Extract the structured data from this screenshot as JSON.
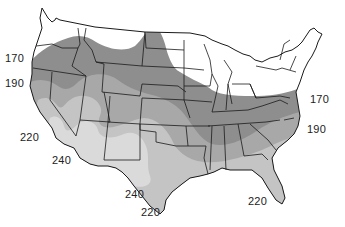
{
  "map": {
    "subject": "Contiguous United States — length of growing season zones",
    "colors": {
      "background": "#ffffff",
      "zone_under_170": "#ffffff",
      "zone_170_190": "#8e8e8e",
      "zone_190_220": "#a8a8a8",
      "zone_220_240": "#c4c4c4",
      "zone_over_240": "#dadada",
      "borders": "#1a1a1a"
    },
    "labels": [
      {
        "id": "west-170",
        "text": "170",
        "x": 5,
        "y": 53
      },
      {
        "id": "west-190",
        "text": "190",
        "x": 5,
        "y": 78
      },
      {
        "id": "sw-220",
        "text": "220",
        "x": 20,
        "y": 132
      },
      {
        "id": "sw-240",
        "text": "240",
        "x": 52,
        "y": 155
      },
      {
        "id": "tx-240",
        "text": "240",
        "x": 125,
        "y": 189
      },
      {
        "id": "tx-220",
        "text": "220",
        "x": 141,
        "y": 207
      },
      {
        "id": "gulf-220",
        "text": "220",
        "x": 248,
        "y": 196
      },
      {
        "id": "east-170",
        "text": "170",
        "x": 310,
        "y": 94
      },
      {
        "id": "east-190",
        "text": "190",
        "x": 307,
        "y": 124
      }
    ]
  }
}
